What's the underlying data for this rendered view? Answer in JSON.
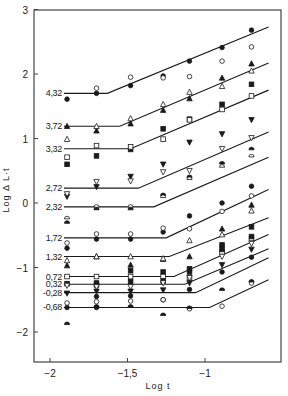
{
  "chart_data": {
    "type": "scatter",
    "title": "",
    "xlabel": "Log t",
    "ylabel": "Log Δ L·t",
    "xlim": [
      -2.1,
      -0.5
    ],
    "ylim": [
      -2.7,
      3
    ],
    "xticks": [
      -2,
      -1.5,
      -1
    ],
    "xtick_labels": [
      "-2",
      "-1,5",
      "-1"
    ],
    "yticks": [
      3,
      2,
      1,
      0,
      -1,
      -2
    ],
    "ytick_labels": [
      "3",
      "2",
      "1",
      "0",
      "-1",
      "-2"
    ],
    "grid": false,
    "legend": "inline series labels at left of each fitted line",
    "x": [
      -1.89,
      -1.7,
      -1.48,
      -1.27,
      -1.1,
      -0.89,
      -0.7
    ],
    "series": [
      {
        "name": "4,32",
        "line": {
          "plateau": 1.7,
          "break_x": -1.63,
          "end_x": -0.59,
          "end_y": 2.73
        },
        "points": [
          {
            "marker": "filled-circle",
            "values": [
              1.61,
              1.7,
              1.82,
              1.97,
              2.2,
              2.41,
              2.68
            ]
          },
          {
            "marker": "open-circle",
            "values": [
              null,
              1.78,
              1.95,
              1.94,
              1.96,
              2.2,
              2.42
            ]
          }
        ]
      },
      {
        "name": "3,72",
        "line": {
          "plateau": 1.19,
          "break_x": -1.55,
          "end_x": -0.59,
          "end_y": 2.17
        },
        "points": [
          {
            "marker": "filled-triangle-up",
            "values": [
              1.19,
              1.12,
              1.23,
              1.44,
              1.62,
              1.94,
              2.16
            ]
          },
          {
            "marker": "open-triangle-up",
            "values": [
              0.99,
              1.19,
              1.31,
              1.53,
              1.72,
              1.81,
              2.05
            ]
          }
        ]
      },
      {
        "name": "3,32",
        "line": {
          "plateau": 0.84,
          "break_x": -1.48,
          "end_x": -0.59,
          "end_y": 1.75
        },
        "points": [
          {
            "marker": "filled-square",
            "values": [
              0.6,
              0.73,
              0.83,
              1.15,
              1.3,
              1.53,
              1.84
            ]
          },
          {
            "marker": "open-square",
            "values": [
              0.71,
              0.89,
              0.87,
              0.99,
              1.29,
              1.45,
              1.66
            ]
          }
        ]
      },
      {
        "name": "2,72",
        "line": {
          "plateau": 0.23,
          "break_x": -1.43,
          "end_x": -0.59,
          "end_y": 1.1
        },
        "points": [
          {
            "marker": "filled-triangle-down",
            "values": [
              0.1,
              0.25,
              0.41,
              0.6,
              0.94,
              1.07,
              1.29
            ]
          },
          {
            "marker": "open-triangle-down",
            "values": [
              0.14,
              0.33,
              0.34,
              0.48,
              0.5,
              0.84,
              1.01
            ]
          }
        ]
      },
      {
        "name": "2,32",
        "line": {
          "plateau": -0.06,
          "break_x": -1.33,
          "end_x": -0.59,
          "end_y": 0.71
        },
        "points": [
          {
            "marker": "filled-half-circle",
            "values": [
              -0.3,
              -0.09,
              -0.09,
              0.13,
              0.41,
              0.62,
              0.84
            ]
          },
          {
            "marker": "open-half-circle",
            "values": [
              -0.23,
              -0.05,
              -0.05,
              0.1,
              0.38,
              0.57,
              0.73
            ]
          }
        ]
      },
      {
        "name": "1,72",
        "line": {
          "plateau": -0.54,
          "break_x": -1.25,
          "end_x": -0.59,
          "end_y": 0.21
        },
        "points": [
          {
            "marker": "filled-circle",
            "values": [
              -0.7,
              -0.56,
              -0.56,
              -0.45,
              -0.2,
              0.0,
              0.26
            ]
          },
          {
            "marker": "open-circle",
            "values": [
              -0.62,
              -0.48,
              -0.48,
              -0.39,
              -0.4,
              -0.13,
              0.11
            ]
          }
        ]
      },
      {
        "name": "1,32",
        "line": {
          "plateau": -0.83,
          "break_x": -1.23,
          "end_x": -0.59,
          "end_y": -0.23
        },
        "points": [
          {
            "marker": "filled-triangle-up",
            "values": [
              -0.97,
              -0.83,
              -0.96,
              -0.87,
              -0.83,
              -0.4,
              -0.03
            ]
          },
          {
            "marker": "open-triangle-up",
            "values": [
              -0.89,
              -0.83,
              -0.83,
              -0.86,
              -0.58,
              -0.49,
              -0.12
            ]
          }
        ]
      },
      {
        "name": "0,72",
        "line": {
          "plateau": -1.14,
          "break_x": -1.2,
          "end_x": -0.59,
          "end_y": -0.49
        },
        "points": [
          {
            "marker": "filled-square",
            "values": [
              null,
              -1.24,
              -1.05,
              -1.07,
              -1.07,
              -0.65,
              -0.37
            ]
          },
          {
            "marker": "open-square",
            "values": [
              -1.14,
              -1.14,
              -1.14,
              -1.14,
              -1.16,
              -0.76,
              -0.55
            ]
          }
        ]
      },
      {
        "name": "0,32",
        "line": {
          "plateau": -1.26,
          "break_x": -1.13,
          "end_x": -0.59,
          "end_y": -0.71
        },
        "points": [
          {
            "marker": "filled-square",
            "values": [
              -1.25,
              -1.27,
              -1.22,
              -1.21,
              -1.02,
              -0.72,
              -0.52
            ]
          },
          {
            "marker": "open-triangle-down",
            "values": [
              -1.28,
              -1.3,
              -1.3,
              -1.24,
              -1.16,
              -0.83,
              -0.63
            ]
          }
        ]
      },
      {
        "name": "-0,28",
        "line": {
          "plateau": -1.39,
          "break_x": -1.06,
          "end_x": -0.59,
          "end_y": -0.85
        },
        "points": [
          {
            "marker": "filled-triangle-down",
            "values": [
              -1.4,
              -1.37,
              -1.37,
              -1.35,
              -1.24,
              -0.96,
              -0.72
            ]
          },
          {
            "marker": "filled-circle",
            "values": [
              null,
              -1.45,
              -1.44,
              -1.5,
              -1.34,
              -1.07,
              -0.84
            ]
          }
        ]
      },
      {
        "name": "-0,68",
        "line": {
          "plateau": -1.62,
          "break_x": -0.97,
          "end_x": -0.59,
          "end_y": -1.19
        },
        "points": [
          {
            "marker": "filled-circle",
            "values": [
              -1.62,
              -1.62,
              null,
              null,
              null,
              null,
              null
            ]
          },
          {
            "marker": "open-circle",
            "values": [
              -1.55,
              -1.53,
              -1.52,
              -1.5,
              -1.64,
              -1.6,
              -1.24
            ]
          },
          {
            "marker": "filled-half-circle",
            "values": [
              -1.87,
              -1.6,
              -1.6,
              -1.73,
              -1.62,
              -1.34,
              -1.21
            ]
          }
        ]
      }
    ]
  },
  "layout": {
    "plot_left_px": 34,
    "plot_top_px": 10,
    "plot_right_px": 281,
    "plot_bottom_px": 362,
    "x0_px": 50,
    "x_px_per_unit": 155,
    "y0_px": 203,
    "y_px_per_unit": 64.5
  },
  "colors": {
    "ink": "#1a1a1a",
    "axis": "#444444",
    "background": "#ffffff"
  }
}
